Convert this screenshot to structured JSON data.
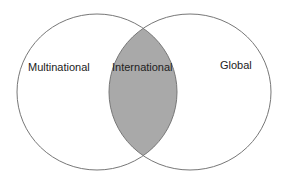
{
  "diagram": {
    "type": "venn",
    "sets": [
      {
        "label": "Multinational",
        "cx": 97,
        "cy": 92,
        "rx": 80,
        "ry": 78
      },
      {
        "label": "Global",
        "cx": 190,
        "cy": 92,
        "rx": 81,
        "ry": 78
      }
    ],
    "intersection": {
      "label": "International",
      "fill": "#a9a9a9"
    },
    "colors": {
      "stroke": "#777777",
      "background": "#ffffff",
      "text": "#222222"
    }
  }
}
